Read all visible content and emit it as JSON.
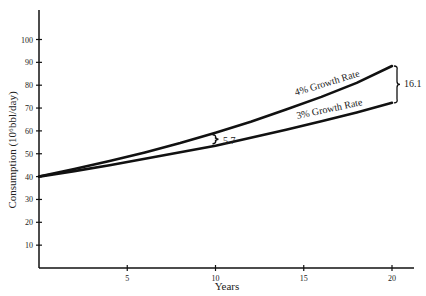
{
  "chart_data": {
    "type": "line",
    "title": "",
    "xlabel": "Years",
    "ylabel": "Consumption (10⁶bbl/day)",
    "xlim": [
      0,
      21
    ],
    "ylim": [
      0,
      110
    ],
    "x_ticks": [
      5,
      10,
      15,
      20
    ],
    "y_ticks": [
      10,
      20,
      30,
      40,
      50,
      60,
      70,
      80,
      90,
      100
    ],
    "grid": false,
    "legend": "none (inline series labels)",
    "x": [
      0,
      2,
      4,
      6,
      8,
      10,
      12,
      14,
      16,
      18,
      20
    ],
    "series": [
      {
        "name": "4% Growth Rate",
        "values": [
          40,
          43.3,
          46.8,
          50.6,
          54.7,
          59.2,
          64.0,
          69.3,
          74.9,
          81.0,
          88.4
        ]
      },
      {
        "name": "3% Growth Rate",
        "values": [
          40,
          42.4,
          45.0,
          47.8,
          50.7,
          53.5,
          57.0,
          60.5,
          64.2,
          68.1,
          72.3
        ]
      }
    ],
    "annotations": [
      {
        "text": "5.7",
        "x": 10,
        "type": "brace",
        "between": [
          "3% Growth Rate",
          "4% Growth Rate"
        ]
      },
      {
        "text": "16.1",
        "x": 20,
        "type": "brace",
        "between": [
          "3% Growth Rate",
          "4% Growth Rate"
        ]
      }
    ]
  },
  "labels": {
    "xlabel": "Years",
    "ylabel": "Consumption (10⁶bbl/day)",
    "series_4": "4% Growth Rate",
    "series_3": "3% Growth Rate",
    "diff_10": "5.7",
    "diff_20": "16.1"
  }
}
